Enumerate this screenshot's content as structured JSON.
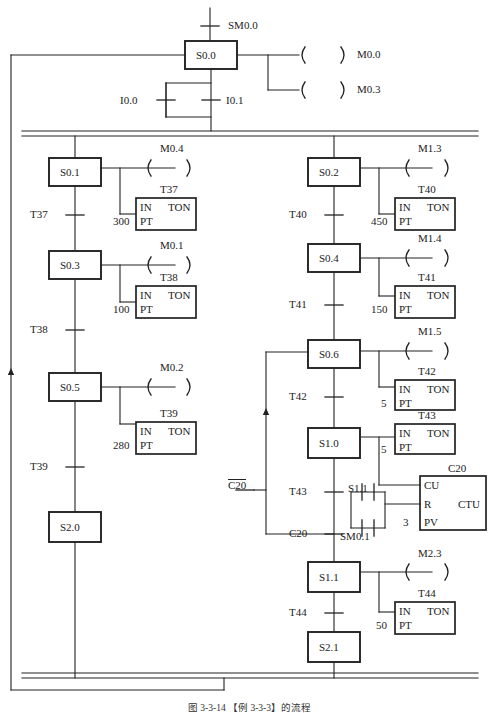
{
  "figure": {
    "caption": "图 3-3-14  【例 3-3-3】的流程",
    "type": "sfc-ladder-diagram"
  },
  "top": {
    "init_contact": "SM0.0",
    "init_step": "S0.0",
    "coils": [
      {
        "label": "M0.0"
      },
      {
        "label": "M0.3"
      }
    ],
    "transition_contacts": [
      {
        "label": "I0.0"
      },
      {
        "label": "I0.1"
      }
    ]
  },
  "left_branch": {
    "steps": [
      {
        "step": "S0.1",
        "coil": "M0.4",
        "timer": {
          "name": "T37",
          "in": "IN",
          "type": "TON",
          "pt_label": "PT",
          "preset": "300"
        },
        "transition": "T37"
      },
      {
        "step": "S0.3",
        "coil": "M0.1",
        "timer": {
          "name": "T38",
          "in": "IN",
          "type": "TON",
          "pt_label": "PT",
          "preset": "100"
        },
        "transition": "T38"
      },
      {
        "step": "S0.5",
        "coil": "M0.2",
        "timer": {
          "name": "T39",
          "in": "IN",
          "type": "TON",
          "pt_label": "PT",
          "preset": "280"
        },
        "transition": "T39"
      },
      {
        "step": "S2.0",
        "coil": null,
        "timer": null,
        "transition": null
      }
    ]
  },
  "right_branch": {
    "steps": [
      {
        "step": "S0.2",
        "coil": "M1.3",
        "timer": {
          "name": "T40",
          "in": "IN",
          "type": "TON",
          "pt_label": "PT",
          "preset": "450"
        },
        "transition": "T40"
      },
      {
        "step": "S0.4",
        "coil": "M1.4",
        "timer": {
          "name": "T41",
          "in": "IN",
          "type": "TON",
          "pt_label": "PT",
          "preset": "150"
        },
        "transition": "T41"
      },
      {
        "step": "S0.6",
        "coil": "M1.5",
        "timer": {
          "name": "T42",
          "in": "IN",
          "type": "TON",
          "pt_label": "PT",
          "preset": "5"
        },
        "transition": "T42"
      },
      {
        "step": "S1.0",
        "coil": null,
        "timer": {
          "name": "T43",
          "in": "IN",
          "type": "TON",
          "pt_label": "PT",
          "preset": "5"
        },
        "transition": "T43"
      },
      {
        "step": "S1.1",
        "coil": "M2.3",
        "timer": {
          "name": "T44",
          "in": "IN",
          "type": "TON",
          "pt_label": "PT",
          "preset": "50"
        },
        "transition": "T44"
      },
      {
        "step": "S2.1",
        "coil": null,
        "timer": null,
        "transition": null
      }
    ],
    "counter": {
      "name": "C20",
      "type": "CTU",
      "cu_label": "CU",
      "r_label": "R",
      "pv_label": "PV",
      "preset": "3",
      "reset_contacts": [
        {
          "label": "S1.1"
        },
        {
          "label": "SM0.1"
        }
      ]
    },
    "loop_back_contact": "C20",
    "loop_back_contact_inverted": "C20",
    "counter_transition": "C20"
  },
  "colors": {
    "line": "#222222",
    "text": "#222222",
    "background": "#ffffff"
  }
}
